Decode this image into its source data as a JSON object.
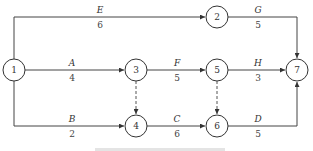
{
  "diagram": {
    "type": "activity-on-arrow network plan",
    "nodes": [
      {
        "id": "1",
        "label": "1"
      },
      {
        "id": "2",
        "label": "2"
      },
      {
        "id": "3",
        "label": "3"
      },
      {
        "id": "4",
        "label": "4"
      },
      {
        "id": "5",
        "label": "5"
      },
      {
        "id": "6",
        "label": "6"
      },
      {
        "id": "7",
        "label": "7"
      }
    ],
    "activities": [
      {
        "name": "E",
        "duration": "6",
        "from": "1",
        "to": "2"
      },
      {
        "name": "A",
        "duration": "4",
        "from": "1",
        "to": "3"
      },
      {
        "name": "B",
        "duration": "2",
        "from": "1",
        "to": "4"
      },
      {
        "name": "G",
        "duration": "5",
        "from": "2",
        "to": "7"
      },
      {
        "name": "F",
        "duration": "5",
        "from": "3",
        "to": "5"
      },
      {
        "name": "C",
        "duration": "6",
        "from": "4",
        "to": "6"
      },
      {
        "name": "H",
        "duration": "3",
        "from": "5",
        "to": "7"
      },
      {
        "name": "D",
        "duration": "5",
        "from": "6",
        "to": "7"
      }
    ],
    "dummy_activities": [
      {
        "from": "3",
        "to": "4"
      },
      {
        "from": "5",
        "to": "6"
      }
    ]
  }
}
